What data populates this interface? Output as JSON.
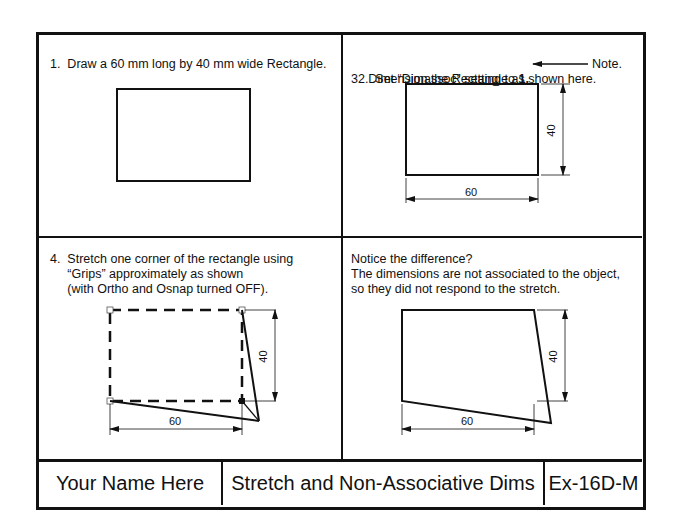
{
  "panels": [
    {
      "lines": [
        "1.  Draw a 60 mm long by 40 mm wide Rectangle."
      ]
    },
    {
      "lines": [
        "2.  Set “Dimassoc” setting to ",
        "1.",
        "Note.",
        "3.  Dimension the Rectangle as shown here."
      ]
    },
    {
      "lines": [
        "4.  Stretch one corner of the rectangle using",
        "     “Grips” approximately as shown",
        "     (with Ortho and Osnap turned OFF)."
      ]
    },
    {
      "lines": [
        "Notice the difference?",
        "The dimensions are not associated to the object,",
        "so they did not respond to the stretch."
      ]
    }
  ],
  "dimensions": {
    "length": "60",
    "width": "40"
  },
  "title_block": {
    "name": "Your Name Here",
    "title": "Stretch and Non-Associative Dims",
    "exercise": "Ex-16D-M"
  }
}
